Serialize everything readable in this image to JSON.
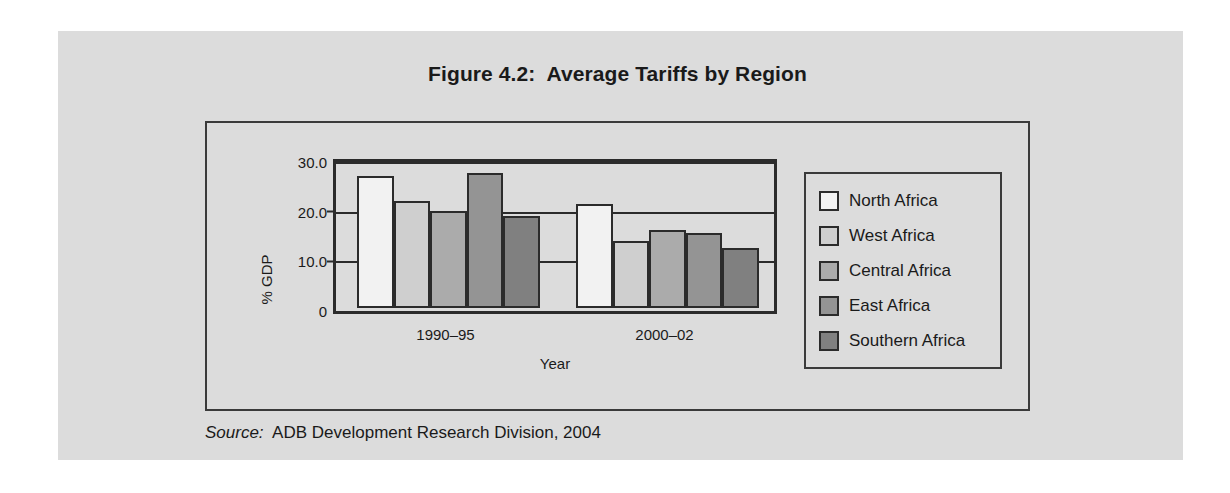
{
  "page": {
    "background_color": "#dcdcdc",
    "rule_color": "#7a7a7a"
  },
  "figure": {
    "title": "Figure 4.2:  Average Tariffs by Region",
    "source_label": "Source:",
    "source_text": "  ADB Development Research Division, 2004"
  },
  "chart_data": {
    "type": "bar",
    "title": "Figure 4.2:  Average Tariffs by Region",
    "xlabel": "Year",
    "ylabel": "% GDP",
    "categories": [
      "1990–95",
      "2000–02"
    ],
    "ylim": [
      0,
      30
    ],
    "yticks": [
      "0",
      "10.0",
      "20.0",
      "30.0"
    ],
    "ytick_values": [
      0,
      10,
      20,
      30
    ],
    "grid": true,
    "legend_position": "right",
    "series": [
      {
        "name": "North Africa",
        "color": "#f2f2f2",
        "values": [
          27.6,
          21.8
        ]
      },
      {
        "name": "West Africa",
        "color": "#cfcfcf",
        "values": [
          22.4,
          14.1
        ]
      },
      {
        "name": "Central Africa",
        "color": "#ababab",
        "values": [
          20.4,
          16.3
        ]
      },
      {
        "name": "East Africa",
        "color": "#949494",
        "values": [
          28.4,
          15.7
        ]
      },
      {
        "name": "Southern Africa",
        "color": "#808080",
        "values": [
          19.4,
          12.5
        ]
      }
    ]
  }
}
